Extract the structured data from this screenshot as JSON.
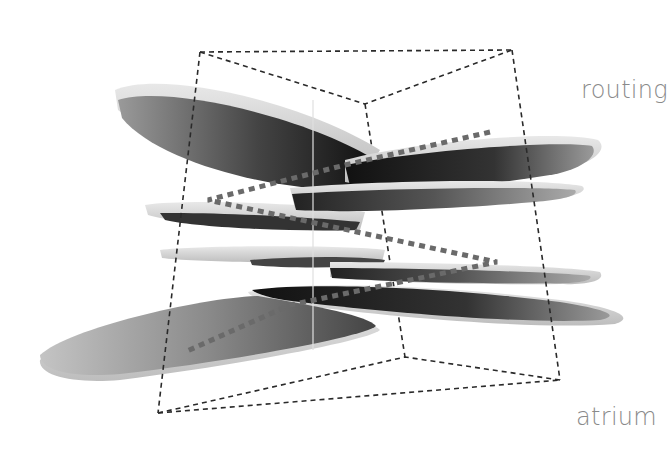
{
  "diagram": {
    "type": "architectural-section-axonometric",
    "labels": {
      "top": "routing",
      "bottom": "atrium"
    },
    "colors": {
      "background": "#ffffff",
      "label": "#8a8a8a",
      "box_dash": "#2a2a2a",
      "route_dash": "#666666",
      "slab_dark": "#111111",
      "slab_light": "#d8d8d8"
    },
    "bounding_box": {
      "style": "dashed",
      "top_face": [
        [
          200,
          52
        ],
        [
          512,
          50
        ],
        [
          365,
          104
        ]
      ],
      "bottom_face": [
        [
          158,
          413
        ],
        [
          560,
          380
        ],
        [
          405,
          357
        ]
      ]
    },
    "slabs": [
      {
        "name": "slab-1-upper-left",
        "level": 1
      },
      {
        "name": "slab-2-upper-right",
        "level": 1
      },
      {
        "name": "slab-3-mid-left",
        "level": 2
      },
      {
        "name": "slab-4-mid-right",
        "level": 2
      },
      {
        "name": "slab-5-center-left",
        "level": 3
      },
      {
        "name": "slab-6-center-right",
        "level": 3
      },
      {
        "name": "slab-7-lower-right",
        "level": 4
      },
      {
        "name": "slab-8-lower-left",
        "level": 4
      }
    ],
    "route_path": "zig-zag dotted circulation path through slabs"
  }
}
